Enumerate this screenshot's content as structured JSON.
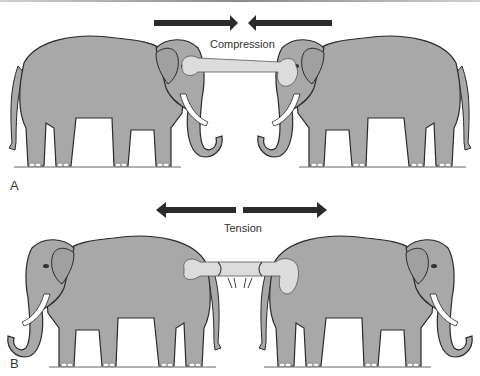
{
  "figure": {
    "panels": [
      {
        "letter": "A",
        "force_label": "Compression",
        "arrows": "pointing-inward"
      },
      {
        "letter": "B",
        "force_label": "Tension",
        "arrows": "pointing-outward"
      }
    ]
  },
  "colors": {
    "elephant_fill": "#a8a8a8",
    "elephant_outline": "#2a2a2a",
    "bone_fill": "#dcdcdc",
    "arrow_fill": "#2b2b2b",
    "tusk_fill": "#ffffff"
  }
}
